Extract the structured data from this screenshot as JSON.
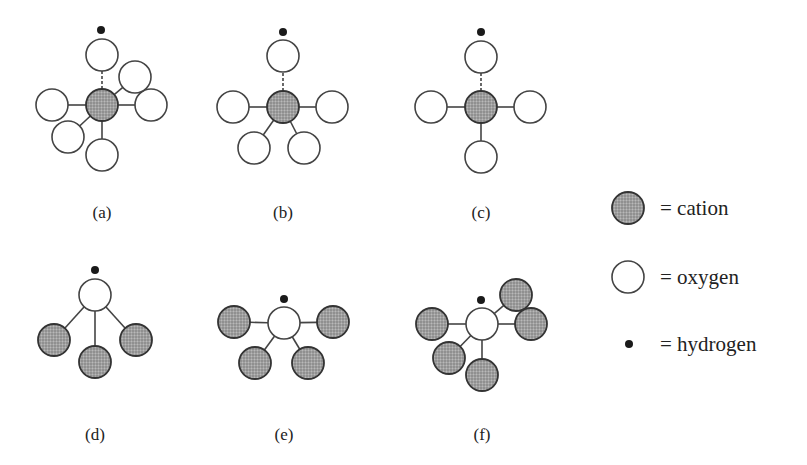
{
  "figure": {
    "panels": [
      {
        "label": "(a)",
        "label_pos": [
          102,
          218
        ],
        "central": "cation",
        "center": [
          102,
          105
        ],
        "hydrogen": [
          101,
          30
        ],
        "neighbors": [
          {
            "type": "oxygen",
            "pos": [
              102,
              55
            ],
            "bond": "dashed",
            "protonated": true
          },
          {
            "type": "oxygen",
            "pos": [
              52,
              105
            ],
            "bond": "solid"
          },
          {
            "type": "oxygen",
            "pos": [
              151,
              105
            ],
            "bond": "solid"
          },
          {
            "type": "oxygen",
            "pos": [
              135,
              77
            ],
            "bond": "solid"
          },
          {
            "type": "oxygen",
            "pos": [
              68,
              137
            ],
            "bond": "solid"
          },
          {
            "type": "oxygen",
            "pos": [
              102,
              155
            ],
            "bond": "solid"
          }
        ]
      },
      {
        "label": "(b)",
        "label_pos": [
          283,
          218
        ],
        "central": "cation",
        "center": [
          283,
          107
        ],
        "hydrogen": [
          283,
          32
        ],
        "neighbors": [
          {
            "type": "oxygen",
            "pos": [
              283,
              56
            ],
            "bond": "dashed",
            "protonated": true
          },
          {
            "type": "oxygen",
            "pos": [
              233,
              107
            ],
            "bond": "solid"
          },
          {
            "type": "oxygen",
            "pos": [
              332,
              107
            ],
            "bond": "solid"
          },
          {
            "type": "oxygen",
            "pos": [
              254,
              148
            ],
            "bond": "solid"
          },
          {
            "type": "oxygen",
            "pos": [
              304,
              148
            ],
            "bond": "solid"
          }
        ]
      },
      {
        "label": "(c)",
        "label_pos": [
          481,
          218
        ],
        "central": "cation",
        "center": [
          481,
          107
        ],
        "hydrogen": [
          481,
          32
        ],
        "neighbors": [
          {
            "type": "oxygen",
            "pos": [
              481,
              57
            ],
            "bond": "dashed",
            "protonated": true
          },
          {
            "type": "oxygen",
            "pos": [
              431,
              107
            ],
            "bond": "solid"
          },
          {
            "type": "oxygen",
            "pos": [
              530,
              107
            ],
            "bond": "solid"
          },
          {
            "type": "oxygen",
            "pos": [
              481,
              157
            ],
            "bond": "solid"
          }
        ]
      },
      {
        "label": "(d)",
        "label_pos": [
          95,
          440
        ],
        "central": "oxygen",
        "center": [
          95,
          295
        ],
        "hydrogen": [
          95,
          270
        ],
        "neighbors": [
          {
            "type": "cation",
            "pos": [
              54,
              340
            ],
            "bond": "solid"
          },
          {
            "type": "cation",
            "pos": [
              95,
              362
            ],
            "bond": "solid"
          },
          {
            "type": "cation",
            "pos": [
              136,
              340
            ],
            "bond": "solid"
          }
        ]
      },
      {
        "label": "(e)",
        "label_pos": [
          284,
          440
        ],
        "central": "oxygen",
        "center": [
          284,
          323
        ],
        "hydrogen": [
          284,
          299
        ],
        "neighbors": [
          {
            "type": "cation",
            "pos": [
              234,
              322
            ],
            "bond": "solid"
          },
          {
            "type": "cation",
            "pos": [
              333,
              322
            ],
            "bond": "solid"
          },
          {
            "type": "cation",
            "pos": [
              255,
              363
            ],
            "bond": "solid"
          },
          {
            "type": "cation",
            "pos": [
              308,
              363
            ],
            "bond": "solid"
          }
        ]
      },
      {
        "label": "(f)",
        "label_pos": [
          482,
          440
        ],
        "central": "oxygen",
        "center": [
          482,
          324
        ],
        "hydrogen": [
          481,
          300
        ],
        "neighbors": [
          {
            "type": "cation",
            "pos": [
              432,
              324
            ],
            "bond": "solid"
          },
          {
            "type": "cation",
            "pos": [
              516,
              295
            ],
            "bond": "solid"
          },
          {
            "type": "cation",
            "pos": [
              531,
              324
            ],
            "bond": "solid"
          },
          {
            "type": "cation",
            "pos": [
              449,
              358
            ],
            "bond": "solid"
          },
          {
            "type": "cation",
            "pos": [
              482,
              375
            ],
            "bond": "solid"
          }
        ]
      }
    ],
    "legend": {
      "items": [
        {
          "symbol": "cation",
          "text": "= cation"
        },
        {
          "symbol": "oxygen",
          "text": "= oxygen"
        },
        {
          "symbol": "hydrogen",
          "text": "= hydrogen"
        }
      ]
    },
    "colors": {
      "cation_fill": "#9a9a9a",
      "outline": "#444444",
      "hydrogen": "#1a1a1a",
      "background": "#ffffff"
    }
  }
}
